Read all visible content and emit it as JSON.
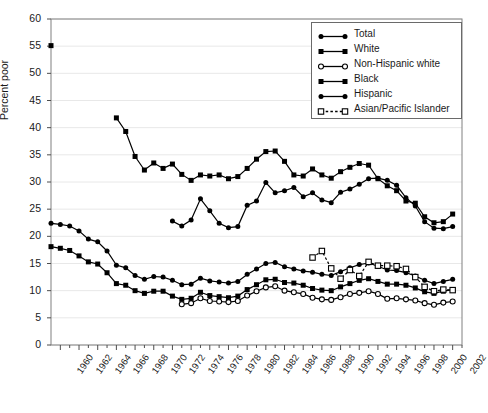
{
  "chart_data": {
    "type": "line",
    "title": "",
    "xlabel": "",
    "ylabel": "Percent poor",
    "ylim": [
      0,
      60
    ],
    "ytick_step": 5,
    "xlim": [
      1959,
      2003
    ],
    "xtick_step": 2,
    "grid": true,
    "grid_color": "#e8e8e8",
    "frame_color": "#808080",
    "legend_position": "top-right",
    "yticks": [
      "0",
      "5",
      "10",
      "15",
      "20",
      "25",
      "30",
      "35",
      "40",
      "45",
      "50",
      "55",
      "60"
    ],
    "xticks": [
      "1960",
      "1962",
      "1964",
      "1966",
      "1968",
      "1970",
      "1972",
      "1974",
      "1976",
      "1978",
      "1980",
      "1982",
      "1984",
      "1986",
      "1988",
      "1990",
      "1992",
      "1994",
      "1996",
      "1998",
      "2000",
      "2002"
    ],
    "series": [
      {
        "name": "Total",
        "marker": "filled-circle",
        "line": "solid",
        "color": "#000000",
        "points": [
          [
            1959,
            22.4
          ],
          [
            1960,
            22.2
          ],
          [
            1961,
            21.9
          ],
          [
            1962,
            21.0
          ],
          [
            1963,
            19.5
          ],
          [
            1964,
            19.0
          ],
          [
            1965,
            17.3
          ],
          [
            1966,
            14.7
          ],
          [
            1967,
            14.2
          ],
          [
            1968,
            12.8
          ],
          [
            1969,
            12.1
          ],
          [
            1970,
            12.6
          ],
          [
            1971,
            12.5
          ],
          [
            1972,
            11.9
          ],
          [
            1973,
            11.1
          ],
          [
            1974,
            11.2
          ],
          [
            1975,
            12.3
          ],
          [
            1976,
            11.8
          ],
          [
            1977,
            11.6
          ],
          [
            1978,
            11.4
          ],
          [
            1979,
            11.7
          ],
          [
            1980,
            13.0
          ],
          [
            1981,
            14.0
          ],
          [
            1982,
            15.0
          ],
          [
            1983,
            15.2
          ],
          [
            1984,
            14.4
          ],
          [
            1985,
            14.0
          ],
          [
            1986,
            13.6
          ],
          [
            1987,
            13.4
          ],
          [
            1988,
            13.0
          ],
          [
            1989,
            12.8
          ],
          [
            1990,
            13.5
          ],
          [
            1991,
            14.2
          ],
          [
            1992,
            14.8
          ],
          [
            1993,
            15.1
          ],
          [
            1994,
            14.5
          ],
          [
            1995,
            13.8
          ],
          [
            1996,
            13.7
          ],
          [
            1997,
            13.3
          ],
          [
            1998,
            12.7
          ],
          [
            1999,
            11.9
          ],
          [
            2000,
            11.3
          ],
          [
            2001,
            11.7
          ],
          [
            2002,
            12.1
          ]
        ]
      },
      {
        "name": "White",
        "marker": "filled-square",
        "line": "solid",
        "color": "#000000",
        "points": [
          [
            1959,
            18.1
          ],
          [
            1960,
            17.8
          ],
          [
            1961,
            17.4
          ],
          [
            1962,
            16.4
          ],
          [
            1963,
            15.3
          ],
          [
            1964,
            14.9
          ],
          [
            1965,
            13.3
          ],
          [
            1966,
            11.3
          ],
          [
            1967,
            11.0
          ],
          [
            1968,
            10.0
          ],
          [
            1969,
            9.5
          ],
          [
            1970,
            9.9
          ],
          [
            1971,
            9.9
          ],
          [
            1972,
            9.0
          ],
          [
            1973,
            8.4
          ],
          [
            1974,
            8.6
          ],
          [
            1975,
            9.7
          ],
          [
            1976,
            9.1
          ],
          [
            1977,
            8.9
          ],
          [
            1978,
            8.7
          ],
          [
            1979,
            9.0
          ],
          [
            1980,
            10.2
          ],
          [
            1981,
            11.1
          ],
          [
            1982,
            12.0
          ],
          [
            1983,
            12.1
          ],
          [
            1984,
            11.5
          ],
          [
            1985,
            11.4
          ],
          [
            1986,
            11.0
          ],
          [
            1987,
            10.4
          ],
          [
            1988,
            10.1
          ],
          [
            1989,
            10.0
          ],
          [
            1990,
            10.7
          ],
          [
            1991,
            11.3
          ],
          [
            1992,
            11.9
          ],
          [
            1993,
            12.2
          ],
          [
            1994,
            11.7
          ],
          [
            1995,
            11.2
          ],
          [
            1996,
            11.2
          ],
          [
            1997,
            11.0
          ],
          [
            1998,
            10.5
          ],
          [
            1999,
            9.8
          ],
          [
            2000,
            9.5
          ],
          [
            2001,
            9.9
          ],
          [
            2002,
            10.2
          ]
        ]
      },
      {
        "name": "Non-Hispanic white",
        "marker": "open-circle",
        "line": "solid",
        "color": "#000000",
        "points": [
          [
            1973,
            7.5
          ],
          [
            1974,
            7.7
          ],
          [
            1975,
            8.6
          ],
          [
            1976,
            8.1
          ],
          [
            1977,
            8.0
          ],
          [
            1978,
            7.9
          ],
          [
            1979,
            8.1
          ],
          [
            1980,
            9.1
          ],
          [
            1981,
            9.9
          ],
          [
            1982,
            10.6
          ],
          [
            1983,
            10.8
          ],
          [
            1984,
            10.0
          ],
          [
            1985,
            9.7
          ],
          [
            1986,
            9.4
          ],
          [
            1987,
            8.7
          ],
          [
            1988,
            8.4
          ],
          [
            1989,
            8.3
          ],
          [
            1990,
            8.8
          ],
          [
            1991,
            9.4
          ],
          [
            1992,
            9.6
          ],
          [
            1993,
            9.9
          ],
          [
            1994,
            9.4
          ],
          [
            1995,
            8.5
          ],
          [
            1996,
            8.6
          ],
          [
            1997,
            8.4
          ],
          [
            1998,
            8.2
          ],
          [
            1999,
            7.7
          ],
          [
            2000,
            7.4
          ],
          [
            2001,
            7.8
          ],
          [
            2002,
            8.0
          ]
        ]
      },
      {
        "name": "Black",
        "marker": "filled-square",
        "line": "solid",
        "color": "#000000",
        "points": [
          [
            1959,
            55.1
          ],
          [
            1966,
            41.8
          ],
          [
            1967,
            39.3
          ],
          [
            1968,
            34.7
          ],
          [
            1969,
            32.2
          ],
          [
            1970,
            33.5
          ],
          [
            1971,
            32.5
          ],
          [
            1972,
            33.3
          ],
          [
            1973,
            31.4
          ],
          [
            1974,
            30.3
          ],
          [
            1975,
            31.3
          ],
          [
            1976,
            31.1
          ],
          [
            1977,
            31.3
          ],
          [
            1978,
            30.6
          ],
          [
            1979,
            31.0
          ],
          [
            1980,
            32.5
          ],
          [
            1981,
            34.2
          ],
          [
            1982,
            35.6
          ],
          [
            1983,
            35.7
          ],
          [
            1984,
            33.8
          ],
          [
            1985,
            31.3
          ],
          [
            1986,
            31.1
          ],
          [
            1987,
            32.4
          ],
          [
            1988,
            31.3
          ],
          [
            1989,
            30.7
          ],
          [
            1990,
            31.9
          ],
          [
            1991,
            32.7
          ],
          [
            1992,
            33.4
          ],
          [
            1993,
            33.1
          ],
          [
            1994,
            30.6
          ],
          [
            1995,
            29.3
          ],
          [
            1996,
            28.4
          ],
          [
            1997,
            26.5
          ],
          [
            1998,
            26.1
          ],
          [
            1999,
            23.6
          ],
          [
            2000,
            22.5
          ],
          [
            2001,
            22.7
          ],
          [
            2002,
            24.1
          ]
        ]
      },
      {
        "name": "Hispanic",
        "marker": "filled-circle",
        "line": "solid",
        "color": "#000000",
        "points": [
          [
            1972,
            22.8
          ],
          [
            1973,
            21.9
          ],
          [
            1974,
            23.0
          ],
          [
            1975,
            26.9
          ],
          [
            1976,
            24.7
          ],
          [
            1977,
            22.4
          ],
          [
            1978,
            21.6
          ],
          [
            1979,
            21.8
          ],
          [
            1980,
            25.7
          ],
          [
            1981,
            26.5
          ],
          [
            1982,
            29.9
          ],
          [
            1983,
            28.0
          ],
          [
            1984,
            28.4
          ],
          [
            1985,
            29.0
          ],
          [
            1986,
            27.3
          ],
          [
            1987,
            28.0
          ],
          [
            1988,
            26.7
          ],
          [
            1989,
            26.2
          ],
          [
            1990,
            28.1
          ],
          [
            1991,
            28.7
          ],
          [
            1992,
            29.6
          ],
          [
            1993,
            30.6
          ],
          [
            1994,
            30.7
          ],
          [
            1995,
            30.3
          ],
          [
            1996,
            29.4
          ],
          [
            1997,
            27.1
          ],
          [
            1998,
            25.6
          ],
          [
            1999,
            22.7
          ],
          [
            2000,
            21.5
          ],
          [
            2001,
            21.4
          ],
          [
            2002,
            21.8
          ]
        ]
      },
      {
        "name": "Asian/Pacific Islander",
        "marker": "open-square",
        "line": "dashed",
        "color": "#000000",
        "points": [
          [
            1987,
            16.1
          ],
          [
            1988,
            17.3
          ],
          [
            1989,
            14.1
          ],
          [
            1990,
            12.2
          ],
          [
            1991,
            13.8
          ],
          [
            1992,
            12.7
          ],
          [
            1993,
            15.3
          ],
          [
            1994,
            14.6
          ],
          [
            1995,
            14.6
          ],
          [
            1996,
            14.5
          ],
          [
            1997,
            14.0
          ],
          [
            1998,
            12.5
          ],
          [
            1999,
            10.7
          ],
          [
            2000,
            9.9
          ],
          [
            2001,
            10.2
          ],
          [
            2002,
            10.1
          ]
        ]
      }
    ]
  }
}
